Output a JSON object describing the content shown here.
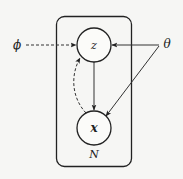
{
  "diagram": {
    "type": "probabilistic-graphical-model",
    "plate": {
      "label": "N"
    },
    "nodes": [
      {
        "id": "z",
        "label": "z",
        "kind": "latent-variable"
      },
      {
        "id": "x",
        "label": "x",
        "kind": "observed-variable"
      }
    ],
    "parameters": [
      {
        "id": "phi",
        "label": "ϕ"
      },
      {
        "id": "theta",
        "label": "θ"
      }
    ],
    "edges": [
      {
        "from": "phi",
        "to": "z",
        "style": "dashed"
      },
      {
        "from": "theta",
        "to": "z",
        "style": "solid"
      },
      {
        "from": "theta",
        "to": "x",
        "style": "solid"
      },
      {
        "from": "z",
        "to": "x",
        "style": "solid"
      },
      {
        "from": "x",
        "to": "z",
        "style": "dashed-curved"
      }
    ],
    "colors": {
      "stroke": "#222222",
      "background": "#f6f6f4"
    }
  }
}
